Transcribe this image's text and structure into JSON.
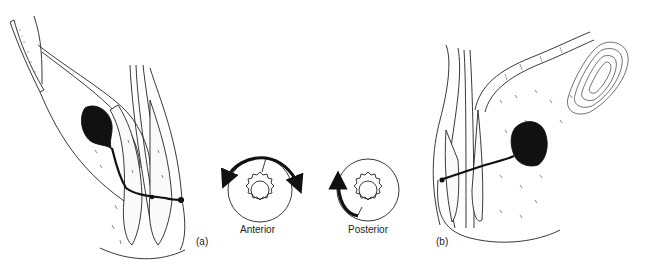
{
  "figure": {
    "panel_a": {
      "label": "(a)"
    },
    "panel_b": {
      "label": "(b)"
    },
    "anterior_diagram": {
      "caption": "Anterior"
    },
    "posterior_diagram": {
      "caption": "Posterior"
    }
  },
  "colors": {
    "ink": "#111111",
    "background": "#ffffff",
    "stipple": "#555555"
  }
}
